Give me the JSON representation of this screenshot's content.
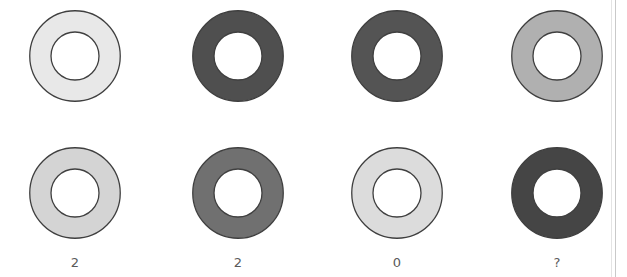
{
  "canvas": {
    "width": 627,
    "height": 277,
    "background": "#ffffff"
  },
  "puzzle": {
    "kind": "grayscale-ring-grid",
    "rows": 2,
    "columns": 4,
    "ring_outer_diameter": 92,
    "ring_inner_diameter": 48,
    "ring_stroke": "#3f3f3f",
    "hole_fill": "#ffffff",
    "column_centers_x": [
      75,
      238,
      397,
      557
    ],
    "row_centers_y": [
      56,
      193
    ],
    "label_y": 256
  },
  "rings": [
    {
      "id": "r1c1",
      "row": 0,
      "column": 0,
      "shade_name": "very-light-gray",
      "fill": "#e8e8e8",
      "center_x": 75,
      "center_y": 56
    },
    {
      "id": "r1c2",
      "row": 0,
      "column": 1,
      "shade_name": "dark-gray",
      "fill": "#4f4f4f",
      "center_x": 238,
      "center_y": 56
    },
    {
      "id": "r1c3",
      "row": 0,
      "column": 2,
      "shade_name": "dark-gray",
      "fill": "#545454",
      "center_x": 397,
      "center_y": 56
    },
    {
      "id": "r1c4",
      "row": 0,
      "column": 3,
      "shade_name": "medium-gray",
      "fill": "#b0b0b0",
      "center_x": 557,
      "center_y": 56
    },
    {
      "id": "r2c1",
      "row": 1,
      "column": 0,
      "shade_name": "light-gray",
      "fill": "#d4d4d4",
      "center_x": 75,
      "center_y": 193
    },
    {
      "id": "r2c2",
      "row": 1,
      "column": 1,
      "shade_name": "medium-dark-gray",
      "fill": "#707070",
      "center_x": 238,
      "center_y": 193
    },
    {
      "id": "r2c3",
      "row": 1,
      "column": 2,
      "shade_name": "light-gray",
      "fill": "#dcdcdc",
      "center_x": 397,
      "center_y": 193
    },
    {
      "id": "r2c4",
      "row": 1,
      "column": 3,
      "shade_name": "dark-gray",
      "fill": "#454545",
      "center_x": 557,
      "center_y": 193
    }
  ],
  "labels": [
    {
      "id": "label-col-1",
      "column": 0,
      "text": "2",
      "center_x": 75
    },
    {
      "id": "label-col-2",
      "column": 1,
      "text": "2",
      "center_x": 238
    },
    {
      "id": "label-col-3",
      "column": 2,
      "text": "0",
      "center_x": 397
    },
    {
      "id": "label-col-4",
      "column": 3,
      "text": "?",
      "center_x": 557
    }
  ],
  "colors": {
    "background": "#ffffff",
    "label_text": "#5a5a5a",
    "outline": "#3f3f3f",
    "page_rule": "#c9c9c9"
  }
}
